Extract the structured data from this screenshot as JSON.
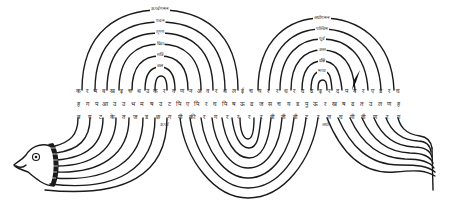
{
  "figure": {
    "colors": {
      "ink": "#1a1a1a",
      "paper": "#ffffff"
    }
  },
  "left_arch": {
    "labels": [
      "ऊर्ध्वगमन",
      "पवन",
      "तृष्ण",
      "दिवा",
      "रात्रि",
      "कल"
    ]
  },
  "right_arch": {
    "labels": [
      "अधोगमन",
      "पश्चिम",
      "पूर्व",
      "उत्तर",
      "दक्षि",
      "मध्य"
    ]
  },
  "rows": {
    "top": [
      "क",
      "र",
      "भ",
      "ब",
      "ख",
      "इ",
      "च",
      "थ",
      "उ",
      "क",
      "र",
      "व",
      "ण",
      "न",
      "अ",
      "व",
      "र",
      "थ",
      "ल",
      "ई",
      "च",
      "य",
      "र",
      "र",
      "ध",
      "र",
      "उ",
      "ढ",
      "इ",
      "र",
      "द",
      "प",
      "ब",
      "र",
      "ए",
      "ड",
      "र",
      "घ"
    ],
    "middle": [
      "ह",
      "ग",
      "प",
      "आ",
      "उ",
      "उ",
      "भ",
      "म",
      "ष",
      "उ",
      "ट",
      "पि",
      "ए",
      "पि",
      "र",
      "घ",
      "पि",
      "ष",
      "ऊ",
      "ढ",
      "ज",
      "स",
      "च",
      "य",
      "ड",
      "पु",
      "ऊ",
      "र",
      "ख",
      "ष",
      "ढ",
      "त",
      "उ",
      "ल",
      "ण",
      "ह"
    ],
    "bottom": [
      "ब",
      "य",
      "ट",
      "के",
      "त",
      "ज",
      "ड",
      "छ",
      "ग",
      "गी",
      "की",
      "र",
      "ग",
      "र",
      "र",
      "र",
      "र",
      "वी",
      "ती",
      "वी",
      "ट",
      "र",
      "ल",
      "घ",
      "गी",
      "वी",
      "ण",
      "र",
      "ग"
    ]
  },
  "side_labels": {
    "left_center": "ऊर्ध्व",
    "right_center": "अधो"
  }
}
